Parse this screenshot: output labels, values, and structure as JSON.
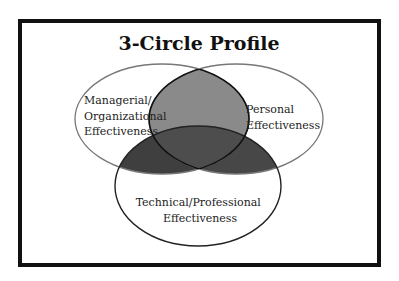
{
  "diagram": {
    "title": "3-Circle Profile",
    "circles": [
      {
        "id": "managerial",
        "label_lines": [
          "Managerial/",
          "Organizational",
          "Effectiveness"
        ]
      },
      {
        "id": "personal",
        "label_lines": [
          "Personal",
          "Effectiveness"
        ]
      },
      {
        "id": "technical",
        "label_lines": [
          "Technical/Professional",
          "Effectiveness"
        ]
      }
    ],
    "colors": {
      "outline": "#111111",
      "overlap_top": "#8a8a8a",
      "overlap_bottom": "#3f3f3f",
      "overlap_center": "#4d4d4d",
      "background": "#ffffff"
    }
  }
}
